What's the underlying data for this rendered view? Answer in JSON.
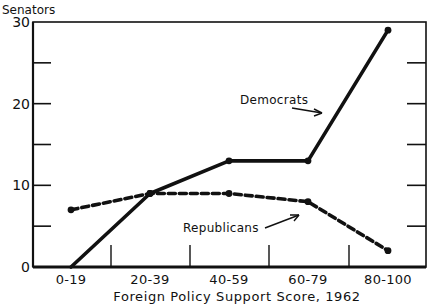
{
  "chart_data": {
    "type": "line",
    "title": "",
    "xlabel": "Foreign Policy Support Score, 1962",
    "ylabel": "Senators",
    "categories": [
      "0-19",
      "20-39",
      "40-59",
      "60-79",
      "80-100"
    ],
    "series": [
      {
        "name": "Democrats",
        "values": [
          0,
          9,
          13,
          13,
          29
        ],
        "style": "solid",
        "color": "#111111"
      },
      {
        "name": "Republicans",
        "values": [
          7,
          9,
          9,
          8,
          2
        ],
        "style": "dashed",
        "color": "#111111"
      }
    ],
    "ylim": [
      0,
      30
    ],
    "yticks": [
      0,
      10,
      20,
      30
    ],
    "yticks_minor": [
      5,
      15,
      25
    ],
    "grid": false,
    "legend": "inline annotations with arrows",
    "annotations": [
      {
        "text": "Democrats",
        "series": "Democrats"
      },
      {
        "text": "Republicans",
        "series": "Republicans"
      }
    ]
  }
}
